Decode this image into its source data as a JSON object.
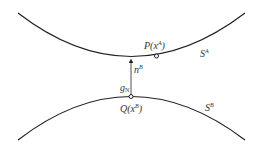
{
  "diagram": {
    "surfaces": {
      "upper": {
        "label": "S",
        "sup": "A"
      },
      "lower": {
        "label": "S",
        "sup": "B"
      }
    },
    "points": {
      "P": {
        "label": "P(x",
        "sup": "A",
        "close": ")"
      },
      "Q": {
        "label": "Q(x",
        "sup": "B",
        "close": ")"
      }
    },
    "normal": {
      "label": "n",
      "sup": "B"
    },
    "gap": {
      "label": "g",
      "sub": "N"
    },
    "colors": {
      "stroke": "#222222",
      "text": "#333333",
      "background": "#ffffff"
    }
  }
}
